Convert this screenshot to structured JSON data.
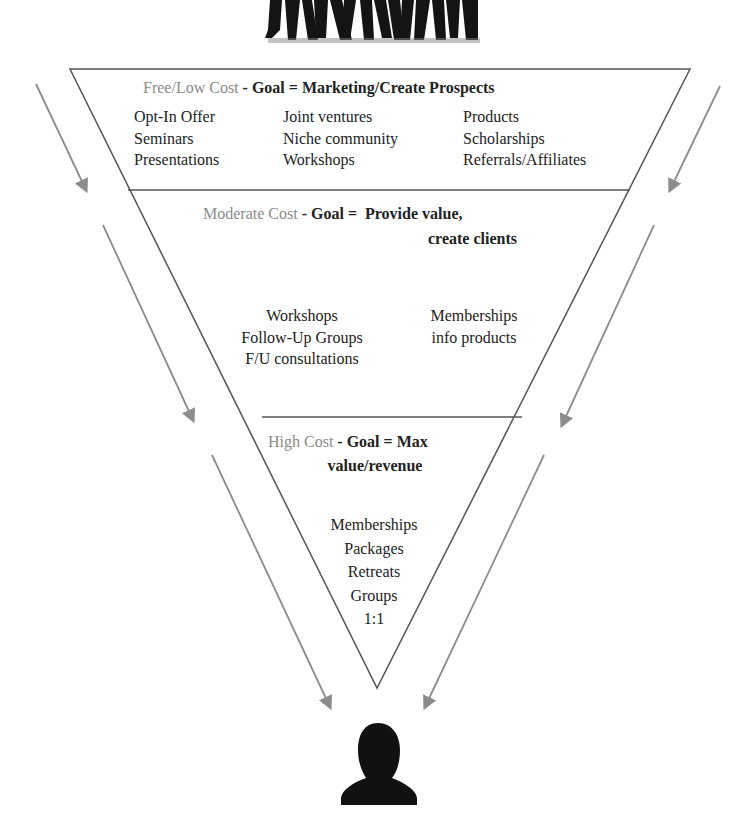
{
  "funnel": {
    "tiers": [
      {
        "cost_label": "Free/Low Cost",
        "goal_prefix": " - Goal = ",
        "goal": "Marketing/Create Prospects",
        "columns": [
          [
            "Opt-In Offer",
            "Seminars",
            "Presentations"
          ],
          [
            "Joint ventures",
            "Niche community",
            "Workshops"
          ],
          [
            "Products",
            "Scholarships",
            "Referrals/Affiliates"
          ]
        ]
      },
      {
        "cost_label": "Moderate Cost",
        "goal_prefix": " - Goal = ",
        "goal_line1": "Provide value,",
        "goal_line2": "create clients",
        "columns": [
          [
            "Workshops",
            "Follow-Up Groups",
            "F/U consultations"
          ],
          [
            "Memberships",
            "info products"
          ]
        ]
      },
      {
        "cost_label": "High Cost",
        "goal_prefix": " - Goal = ",
        "goal_line1": "Max",
        "goal_line2": "value/revenue",
        "items": [
          "Memberships",
          "Packages",
          "Retreats",
          "Groups",
          "1:1"
        ]
      }
    ]
  },
  "icons": {
    "top": "crowd-silhouette-icon",
    "bottom": "person-silhouette-icon"
  },
  "colors": {
    "outline": "#555555",
    "arrow": "#8c8c8c",
    "cost_label": "#8a8a8a",
    "text": "#222222",
    "silhouette": "#111111"
  }
}
